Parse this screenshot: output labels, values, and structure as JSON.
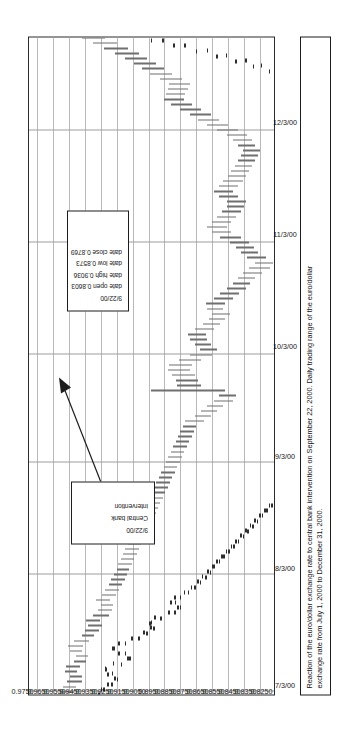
{
  "figure": {
    "caption_line1": "Reaction of the euro/dollar exchange rate to central bank intervention on September 22, 2000. Daily trading range of the euro/dollar",
    "caption_line2": "exchange rate from July 1, 2000 to December 31, 2000."
  },
  "annotations": {
    "ohlc_box": {
      "date": "9/22/00",
      "rows": [
        {
          "label": "date open",
          "value": "0.8603"
        },
        {
          "label": "date high",
          "value": "0.9036"
        },
        {
          "label": "date low",
          "value": "0.8573"
        },
        {
          "label": "date close",
          "value": "0.8769"
        }
      ]
    },
    "intervention_box": {
      "date": "9/22/00",
      "line1": "Central bank",
      "line2": "intervention"
    }
  },
  "chart_data": {
    "type": "ohlc",
    "title": "",
    "subtitle": "",
    "xlabel": "",
    "ylabel": "",
    "grid": true,
    "legend": "none",
    "orientation": "rotated-90-ccw",
    "xlim": [
      "7/1/00",
      "12/31/00"
    ],
    "ylim": [
      0.825,
      0.98
    ],
    "y_ticks": [
      "0.9750",
      "0.9650",
      "0.9550",
      "0.9450",
      "0.9350",
      "0.9250",
      "0.9150",
      "0.9050",
      "0.8950",
      "0.8850",
      "0.8750",
      "0.8650",
      "0.8550",
      "0.8450",
      "0.8350",
      "0.8250"
    ],
    "y_tick_values": [
      0.975,
      0.965,
      0.955,
      0.945,
      0.935,
      0.925,
      0.915,
      0.905,
      0.895,
      0.885,
      0.875,
      0.865,
      0.855,
      0.845,
      0.835,
      0.825
    ],
    "x_ticks": [
      "7/3/00",
      "8/3/00",
      "9/3/00",
      "10/3/00",
      "11/3/00",
      "12/3/00"
    ],
    "x_tick_index": [
      0,
      23,
      45,
      66,
      88,
      110
    ],
    "n_points": 131,
    "columns": [
      "date",
      "open",
      "high",
      "low",
      "close"
    ],
    "points": [
      [
        "7/3/00",
        0.956,
        0.96,
        0.952,
        0.9545
      ],
      [
        "7/4/00",
        0.9545,
        0.9585,
        0.9505,
        0.952
      ],
      [
        "7/5/00",
        0.952,
        0.956,
        0.947,
        0.95
      ],
      [
        "7/6/00",
        0.95,
        0.9545,
        0.9465,
        0.953
      ],
      [
        "7/7/00",
        0.953,
        0.9575,
        0.95,
        0.9545
      ],
      [
        "7/10/00",
        0.9545,
        0.957,
        0.948,
        0.95
      ],
      [
        "7/11/00",
        0.95,
        0.952,
        0.944,
        0.946
      ],
      [
        "7/12/00",
        0.946,
        0.9505,
        0.943,
        0.949
      ],
      [
        "7/13/00",
        0.949,
        0.9545,
        0.947,
        0.952
      ],
      [
        "7/14/00",
        0.952,
        0.9555,
        0.946,
        0.948
      ],
      [
        "7/17/00",
        0.948,
        0.9515,
        0.9425,
        0.944
      ],
      [
        "7/18/00",
        0.944,
        0.947,
        0.939,
        0.941
      ],
      [
        "7/19/00",
        0.941,
        0.945,
        0.936,
        0.9385
      ],
      [
        "7/20/00",
        0.9385,
        0.943,
        0.934,
        0.94
      ],
      [
        "7/21/00",
        0.94,
        0.944,
        0.9355,
        0.937
      ],
      [
        "7/24/00",
        0.937,
        0.94,
        0.93,
        0.932
      ],
      [
        "7/25/00",
        0.932,
        0.9365,
        0.928,
        0.93
      ],
      [
        "7/26/00",
        0.93,
        0.935,
        0.927,
        0.933
      ],
      [
        "7/27/00",
        0.933,
        0.938,
        0.929,
        0.9305
      ],
      [
        "7/28/00",
        0.9305,
        0.9345,
        0.9255,
        0.928
      ],
      [
        "7/31/00",
        0.928,
        0.932,
        0.9235,
        0.926
      ],
      [
        "8/1/00",
        0.926,
        0.93,
        0.9215,
        0.924
      ],
      [
        "8/2/00",
        0.924,
        0.9285,
        0.92,
        0.9225
      ],
      [
        "8/3/00",
        0.9225,
        0.9265,
        0.9185,
        0.921
      ],
      [
        "8/4/00",
        0.921,
        0.925,
        0.917,
        0.9195
      ],
      [
        "8/7/00",
        0.9195,
        0.924,
        0.9155,
        0.918
      ],
      [
        "8/8/00",
        0.918,
        0.9225,
        0.914,
        0.9165
      ],
      [
        "8/9/00",
        0.9165,
        0.921,
        0.9125,
        0.915
      ],
      [
        "8/10/00",
        0.915,
        0.9195,
        0.911,
        0.9135
      ],
      [
        "8/11/00",
        0.9135,
        0.918,
        0.9095,
        0.912
      ],
      [
        "8/14/00",
        0.912,
        0.9165,
        0.908,
        0.9105
      ],
      [
        "8/15/00",
        0.9105,
        0.915,
        0.9065,
        0.909
      ],
      [
        "8/16/00",
        0.909,
        0.9135,
        0.905,
        0.9075
      ],
      [
        "8/17/00",
        0.9075,
        0.912,
        0.9035,
        0.906
      ],
      [
        "8/18/00",
        0.906,
        0.9105,
        0.902,
        0.9045
      ],
      [
        "8/21/00",
        0.9045,
        0.909,
        0.9005,
        0.903
      ],
      [
        "8/22/00",
        0.903,
        0.9075,
        0.899,
        0.9015
      ],
      [
        "8/23/00",
        0.9015,
        0.906,
        0.8975,
        0.9
      ],
      [
        "8/24/00",
        0.9,
        0.9045,
        0.896,
        0.8985
      ],
      [
        "8/25/00",
        0.8985,
        0.903,
        0.8945,
        0.897
      ],
      [
        "8/28/00",
        0.897,
        0.9015,
        0.893,
        0.8955
      ],
      [
        "8/29/00",
        0.8955,
        0.9,
        0.8915,
        0.894
      ],
      [
        "8/30/00",
        0.894,
        0.8985,
        0.89,
        0.8925
      ],
      [
        "8/31/00",
        0.8925,
        0.897,
        0.8885,
        0.891
      ],
      [
        "9/1/00",
        0.891,
        0.8955,
        0.887,
        0.8895
      ],
      [
        "9/4/00",
        0.8895,
        0.894,
        0.8855,
        0.888
      ],
      [
        "9/5/00",
        0.888,
        0.8925,
        0.884,
        0.8865
      ],
      [
        "9/6/00",
        0.8865,
        0.891,
        0.8825,
        0.885
      ],
      [
        "9/7/00",
        0.885,
        0.8895,
        0.881,
        0.8835
      ],
      [
        "9/8/00",
        0.8835,
        0.888,
        0.8795,
        0.882
      ],
      [
        "9/11/00",
        0.882,
        0.8865,
        0.878,
        0.8805
      ],
      [
        "9/12/00",
        0.8805,
        0.885,
        0.8765,
        0.879
      ],
      [
        "9/13/00",
        0.879,
        0.8835,
        0.875,
        0.8775
      ],
      [
        "9/14/00",
        0.8775,
        0.882,
        0.87,
        0.872
      ],
      [
        "9/15/00",
        0.872,
        0.876,
        0.866,
        0.868
      ],
      [
        "9/18/00",
        0.868,
        0.872,
        0.862,
        0.864
      ],
      [
        "9/19/00",
        0.864,
        0.868,
        0.858,
        0.86
      ],
      [
        "9/20/00",
        0.86,
        0.864,
        0.852,
        0.8545
      ],
      [
        "9/21/00",
        0.8545,
        0.8605,
        0.85,
        0.859
      ],
      [
        "9/22/00",
        0.8603,
        0.9036,
        0.8573,
        0.8769
      ],
      [
        "9/25/00",
        0.8769,
        0.887,
        0.872,
        0.879
      ],
      [
        "9/26/00",
        0.879,
        0.888,
        0.874,
        0.881
      ],
      [
        "9/27/00",
        0.881,
        0.8905,
        0.876,
        0.8845
      ],
      [
        "9/28/00",
        0.8845,
        0.893,
        0.879,
        0.886
      ],
      [
        "9/29/00",
        0.886,
        0.892,
        0.878,
        0.8805
      ],
      [
        "10/2/00",
        0.8805,
        0.886,
        0.872,
        0.874
      ],
      [
        "10/3/00",
        0.874,
        0.879,
        0.865,
        0.867
      ],
      [
        "10/4/00",
        0.867,
        0.873,
        0.862,
        0.87
      ],
      [
        "10/5/00",
        0.87,
        0.876,
        0.866,
        0.872
      ],
      [
        "10/6/00",
        0.872,
        0.879,
        0.868,
        0.875
      ],
      [
        "10/9/00",
        0.875,
        0.88,
        0.869,
        0.871
      ],
      [
        "10/10/00",
        0.871,
        0.876,
        0.864,
        0.866
      ],
      [
        "10/11/00",
        0.866,
        0.871,
        0.86,
        0.862
      ],
      [
        "10/12/00",
        0.862,
        0.867,
        0.857,
        0.859
      ],
      [
        "10/13/00",
        0.859,
        0.865,
        0.854,
        0.862
      ],
      [
        "10/16/00",
        0.862,
        0.868,
        0.858,
        0.864
      ],
      [
        "10/17/00",
        0.864,
        0.869,
        0.857,
        0.859
      ],
      [
        "10/18/00",
        0.859,
        0.864,
        0.852,
        0.854
      ],
      [
        "10/19/00",
        0.854,
        0.86,
        0.848,
        0.85
      ],
      [
        "10/20/00",
        0.85,
        0.856,
        0.844,
        0.846
      ],
      [
        "10/23/00",
        0.846,
        0.852,
        0.841,
        0.843
      ],
      [
        "10/24/00",
        0.843,
        0.849,
        0.838,
        0.84
      ],
      [
        "10/25/00",
        0.84,
        0.846,
        0.834,
        0.836
      ],
      [
        "10/26/00",
        0.836,
        0.842,
        0.829,
        0.831
      ],
      [
        "10/27/00",
        0.831,
        0.838,
        0.827,
        0.835
      ],
      [
        "10/30/00",
        0.835,
        0.843,
        0.831,
        0.84
      ],
      [
        "10/31/00",
        0.84,
        0.847,
        0.836,
        0.843
      ],
      [
        "11/1/00",
        0.843,
        0.85,
        0.839,
        0.846
      ],
      [
        "11/2/00",
        0.846,
        0.854,
        0.842,
        0.851
      ],
      [
        "11/3/00",
        0.851,
        0.86,
        0.847,
        0.857
      ],
      [
        "11/6/00",
        0.857,
        0.865,
        0.853,
        0.861
      ],
      [
        "11/7/00",
        0.861,
        0.868,
        0.856,
        0.859
      ],
      [
        "11/8/00",
        0.859,
        0.865,
        0.853,
        0.856
      ],
      [
        "11/9/00",
        0.856,
        0.862,
        0.85,
        0.853
      ],
      [
        "11/10/00",
        0.853,
        0.859,
        0.847,
        0.85
      ],
      [
        "11/13/00",
        0.85,
        0.856,
        0.845,
        0.848
      ],
      [
        "11/14/00",
        0.848,
        0.856,
        0.844,
        0.853
      ],
      [
        "11/15/00",
        0.853,
        0.861,
        0.849,
        0.858
      ],
      [
        "11/16/00",
        0.858,
        0.864,
        0.852,
        0.855
      ],
      [
        "11/17/00",
        0.855,
        0.861,
        0.849,
        0.852
      ],
      [
        "11/20/00",
        0.852,
        0.858,
        0.846,
        0.849
      ],
      [
        "11/21/00",
        0.849,
        0.855,
        0.844,
        0.847
      ],
      [
        "11/22/00",
        0.847,
        0.853,
        0.842,
        0.845
      ],
      [
        "11/23/00",
        0.845,
        0.851,
        0.84,
        0.843
      ],
      [
        "11/24/00",
        0.843,
        0.849,
        0.838,
        0.841
      ],
      [
        "11/27/00",
        0.841,
        0.847,
        0.836,
        0.839
      ],
      [
        "11/28/00",
        0.839,
        0.846,
        0.835,
        0.842
      ],
      [
        "11/29/00",
        0.842,
        0.849,
        0.838,
        0.845
      ],
      [
        "11/30/00",
        0.845,
        0.852,
        0.84,
        0.847
      ],
      [
        "12/1/00",
        0.847,
        0.856,
        0.843,
        0.853
      ],
      [
        "12/4/00",
        0.853,
        0.862,
        0.849,
        0.859
      ],
      [
        "12/5/00",
        0.859,
        0.868,
        0.855,
        0.865
      ],
      [
        "12/6/00",
        0.865,
        0.874,
        0.861,
        0.87
      ],
      [
        "12/7/00",
        0.87,
        0.879,
        0.866,
        0.876
      ],
      [
        "12/8/00",
        0.876,
        0.885,
        0.872,
        0.882
      ],
      [
        "12/11/00",
        0.882,
        0.891,
        0.878,
        0.888
      ],
      [
        "12/12/00",
        0.888,
        0.895,
        0.883,
        0.887
      ],
      [
        "12/13/00",
        0.887,
        0.894,
        0.882,
        0.886
      ],
      [
        "12/14/00",
        0.886,
        0.893,
        0.88,
        0.884
      ],
      [
        "12/15/00",
        0.884,
        0.892,
        0.879,
        0.888
      ],
      [
        "12/18/00",
        0.888,
        0.898,
        0.884,
        0.894
      ],
      [
        "12/19/00",
        0.894,
        0.904,
        0.89,
        0.9
      ],
      [
        "12/20/00",
        0.9,
        0.909,
        0.895,
        0.905
      ],
      [
        "12/21/00",
        0.905,
        0.914,
        0.9,
        0.91
      ],
      [
        "12/22/00",
        0.91,
        0.92,
        0.906,
        0.916
      ],
      [
        "12/26/00",
        0.916,
        0.926,
        0.911,
        0.922
      ],
      [
        "12/27/00",
        0.922,
        0.933,
        0.918,
        0.929
      ],
      [
        "12/28/00",
        0.929,
        0.94,
        0.925,
        0.936
      ],
      [
        "12/29/00",
        0.936,
        0.947,
        0.932,
        0.943
      ]
    ]
  }
}
